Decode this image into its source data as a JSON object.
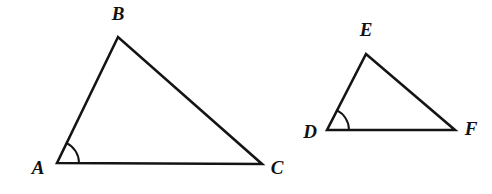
{
  "figure": {
    "background_color": "#ffffff",
    "stroke_color": "#141414",
    "label_color": "#111111",
    "width": 492,
    "height": 194
  },
  "shapes": [
    {
      "id": "triangle-abc",
      "name": "Triangle ABC",
      "vertices": [
        {
          "label": "A",
          "x": 57,
          "y": 163,
          "label_x": 38,
          "label_y": 170
        },
        {
          "label": "B",
          "x": 118,
          "y": 37,
          "label_x": 118,
          "label_y": 16
        },
        {
          "label": "C",
          "x": 262,
          "y": 164,
          "label_x": 277,
          "label_y": 170
        }
      ],
      "angle_mark": {
        "at": "A",
        "radius": 22,
        "type": "single-arc"
      }
    },
    {
      "id": "triangle-def",
      "name": "Triangle DEF",
      "vertices": [
        {
          "label": "D",
          "x": 327,
          "y": 130,
          "label_x": 310,
          "label_y": 134
        },
        {
          "label": "E",
          "x": 366,
          "y": 54,
          "label_x": 366,
          "label_y": 32
        },
        {
          "label": "F",
          "x": 455,
          "y": 130,
          "label_x": 471,
          "label_y": 131
        }
      ],
      "angle_mark": {
        "at": "D",
        "radius": 22,
        "type": "single-arc"
      }
    }
  ],
  "chart_data": {
    "type": "diagram",
    "shapes": [
      {
        "name": "ABC",
        "points": {
          "A": [
            57,
            163
          ],
          "B": [
            118,
            37
          ],
          "C": [
            262,
            164
          ]
        },
        "marked_angle": "A"
      },
      {
        "name": "DEF",
        "points": {
          "D": [
            327,
            130
          ],
          "E": [
            366,
            54
          ],
          "F": [
            455,
            130
          ]
        },
        "marked_angle": "D"
      }
    ]
  }
}
